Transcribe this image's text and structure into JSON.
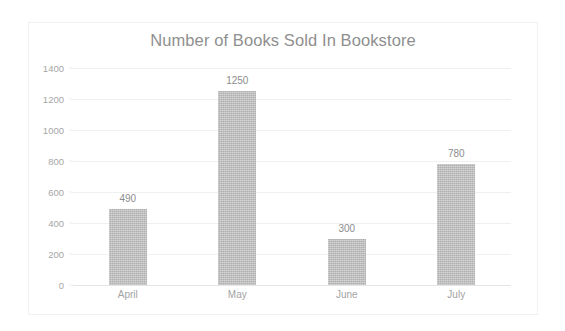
{
  "chart_data": {
    "type": "bar",
    "title": "Number of Books Sold In Bookstore",
    "xlabel": "",
    "ylabel": "",
    "categories": [
      "April",
      "May",
      "June",
      "July"
    ],
    "values": [
      490,
      1250,
      300,
      780
    ],
    "data_labels": [
      "490",
      "1250",
      "300",
      "780"
    ],
    "ylim": [
      0,
      1400
    ],
    "ytick_values": [
      0,
      200,
      400,
      600,
      800,
      1000,
      1200,
      1400
    ],
    "ytick_labels": [
      "0",
      "200",
      "400",
      "600",
      "800",
      "1000",
      "1200",
      "1400"
    ],
    "grid": true,
    "legend": false,
    "legend_position": "none",
    "series": [
      {
        "name": "Books Sold",
        "values": [
          490,
          1250,
          300,
          780
        ]
      }
    ],
    "colors": {
      "bar": "#bcbcbc",
      "gridline": "#f0f0f1",
      "title_text": "#8f8f8f",
      "tick_text": "#a6a6a6",
      "label_text": "#8c8c8c",
      "border": "#f1f1f2",
      "background": "#ffffff"
    }
  }
}
